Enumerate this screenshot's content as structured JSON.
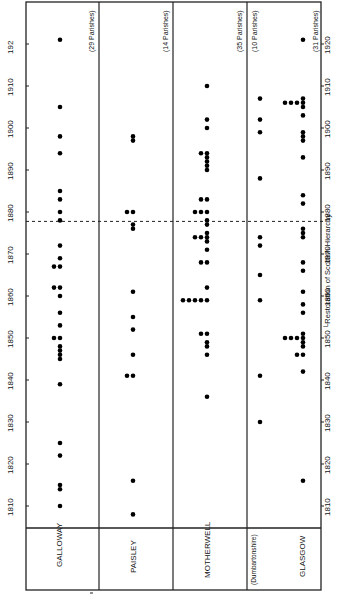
{
  "chart_data": {
    "type": "scatter",
    "orientation": "rotated-90-ccw",
    "title": "",
    "xlabel": "Year",
    "ylabel": "",
    "axis_ticks": [
      1810,
      1820,
      1830,
      1840,
      1850,
      1860,
      1870,
      1880,
      1890,
      1900,
      1910,
      1920
    ],
    "axis_tick_labels_left": [
      "1810",
      "1820",
      "1830",
      "1840",
      "1850",
      "1860",
      "1870",
      "1880",
      "1890",
      "1900",
      "1910",
      "192"
    ],
    "axis_tick_labels_right": [
      "1810",
      "1820",
      "1830",
      "1840",
      "1850",
      "1860",
      "1870",
      "1880",
      "1890",
      "1900",
      "1910",
      "1920"
    ],
    "xlim": [
      1805,
      1922
    ],
    "annotation": {
      "year": 1878,
      "label": "Restoration of Scottish Hierarchy",
      "style": "dashed"
    },
    "grid": false,
    "series": [
      {
        "name": "GALLOWAY",
        "note": "(29 Parishes)",
        "years": [
          1921,
          1905,
          1898,
          1894,
          1885,
          1883,
          1880,
          1878,
          1872,
          1869,
          1867,
          1867,
          1862,
          1862,
          1860,
          1856,
          1853,
          1850,
          1850,
          1848,
          1847,
          1846,
          1845,
          1839,
          1825,
          1822,
          1815,
          1814,
          1810
        ]
      },
      {
        "name": "PAISLEY",
        "note": "(14 Parishes)",
        "years": [
          1898,
          1897,
          1880,
          1880,
          1877,
          1876,
          1861,
          1855,
          1852,
          1846,
          1841,
          1841,
          1816,
          1808
        ]
      },
      {
        "name": "MOTHERWELL",
        "note": "(35 Parishes)",
        "years": [
          1910,
          1902,
          1900,
          1894,
          1894,
          1893,
          1892,
          1891,
          1890,
          1883,
          1883,
          1880,
          1880,
          1880,
          1878,
          1877,
          1875,
          1874,
          1874,
          1874,
          1873,
          1871,
          1868,
          1868,
          1862,
          1859,
          1859,
          1859,
          1859,
          1859,
          1851,
          1851,
          1849,
          1848,
          1846,
          1836
        ]
      },
      {
        "name": "Dumbartonshire",
        "note": "(10 Parishes)",
        "label": "(Dumbartonshire)",
        "years": [
          1907,
          1902,
          1899,
          1888,
          1874,
          1872,
          1865,
          1859,
          1841,
          1830
        ]
      },
      {
        "name": "GLASGOW",
        "note": "(31 Parishes)",
        "years": [
          1921,
          1907,
          1906,
          1906,
          1906,
          1906,
          1905,
          1903,
          1899,
          1898,
          1897,
          1893,
          1884,
          1882,
          1876,
          1875,
          1874,
          1868,
          1866,
          1861,
          1858,
          1856,
          1851,
          1850,
          1850,
          1850,
          1850,
          1849,
          1848,
          1846,
          1846,
          1842,
          1816
        ]
      }
    ]
  },
  "labels": {
    "columns": [
      "GALLOWAY",
      "PAISLEY",
      "MOTHERWELL",
      "(Dumbartonshire)",
      "GLASGOW"
    ],
    "parish_notes": [
      "(29 Parishes)",
      "(14 Parishes)",
      "(35 Parishes)",
      "(10 Parishes)",
      "(31 Parishes)"
    ],
    "annotation": "└Restoration of Scottish Hierarchy"
  }
}
